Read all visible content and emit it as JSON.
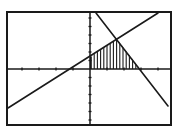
{
  "screen": {
    "description": "Graphing calculator window showing two lines with shaded feasible region",
    "frame": {
      "x": 7,
      "y": 12,
      "width": 164,
      "height": 113,
      "stroke": "#1a1a1a"
    },
    "background": "#ffffff",
    "ink_color": "#1a1a1a"
  },
  "axes": {
    "origin_px": {
      "x": 90,
      "y": 69
    },
    "x_axis": {
      "y_px": 69,
      "x_from": 8,
      "x_to": 170,
      "tick_spacing_px": 17
    },
    "y_axis": {
      "x_px": 90,
      "y_from": 13,
      "y_to": 124,
      "tick_spacing_px": 8.5
    }
  },
  "lines": [
    {
      "name": "increasing-line",
      "from_px": {
        "x": 8,
        "y": 108
      },
      "to_px": {
        "x": 158,
        "y": 13
      }
    },
    {
      "name": "decreasing-line",
      "from_px": {
        "x": 96,
        "y": 13
      },
      "to_px": {
        "x": 168,
        "y": 106
      }
    }
  ],
  "shaded_region": {
    "name": "feasible-region",
    "style": "vertical-hatch",
    "vertices_px": [
      {
        "x": 90,
        "y": 69
      },
      {
        "x": 90,
        "y": 57
      },
      {
        "x": 117,
        "y": 39
      },
      {
        "x": 140,
        "y": 69
      }
    ],
    "hatch_spacing_px": 3.2
  }
}
